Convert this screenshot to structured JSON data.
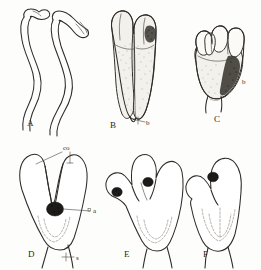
{
  "figure": {
    "kind": "scientific-illustration-plate",
    "background_color": "#fdfdfc",
    "ink_color": "#2e2b28",
    "panel_count": 6,
    "row_count": 2
  },
  "panels": [
    {
      "id": "A",
      "label": "A",
      "name": "panel-a",
      "description": "Pair of long slender sinuous tubular organs with small club-shaped swollen tips",
      "style": "line-drawing",
      "label_x": 27,
      "label_y": 126
    },
    {
      "id": "B",
      "label": "B",
      "name": "panel-b",
      "description": "Elongate bilobed organ with two parallel apical lobes and stippled shading",
      "style": "stippled-wash",
      "label_x": 110,
      "label_y": 128
    },
    {
      "id": "C",
      "label": "C",
      "name": "panel-c",
      "description": "Compact bulbous organ with several short rounded apical lobes and dark shading on right",
      "style": "stippled-wash",
      "label_x": 214,
      "label_y": 122
    },
    {
      "id": "D",
      "label": "D",
      "name": "panel-d",
      "description": "Outline diagram with two tall parallel lobes, central dark body and basal stalk",
      "style": "outline",
      "label_x": 28,
      "label_y": 257
    },
    {
      "id": "E",
      "label": "E",
      "name": "panel-e",
      "description": "Outline diagram with three rounded lobes and two dark bodies",
      "style": "outline",
      "label_x": 124,
      "label_y": 257
    },
    {
      "id": "F",
      "label": "F",
      "name": "panel-f",
      "description": "Outline diagram with one rounded lobe, a lateral shoulder projection and one dark body",
      "style": "outline",
      "label_x": 203,
      "label_y": 257
    }
  ],
  "annotations": [
    {
      "id": "co",
      "text": "co",
      "name": "label-co",
      "panel": "D",
      "meaning": "cornu / lobe apex",
      "text_x": 63,
      "text_y": 150,
      "leaders": 2
    },
    {
      "id": "a",
      "text": "a",
      "name": "label-a",
      "panel": "D",
      "meaning": "dark central body",
      "text_x": 93,
      "text_y": 212,
      "leaders": 1
    },
    {
      "id": "s",
      "text": "s",
      "name": "label-s",
      "panel": "D",
      "meaning": "stalk / stem",
      "text_x": 76,
      "text_y": 259,
      "leaders": 1
    },
    {
      "id": "b-panel-b",
      "text": "b",
      "name": "label-b-panel-b",
      "panel": "B",
      "meaning": "basal structure",
      "text_x": 148,
      "text_y": 125,
      "leaders": 1
    },
    {
      "id": "b-panel-c",
      "text": "b",
      "name": "label-b-panel-c",
      "panel": "C",
      "meaning": "basal structure",
      "text_x": 243,
      "text_y": 84,
      "leaders": 0
    }
  ]
}
